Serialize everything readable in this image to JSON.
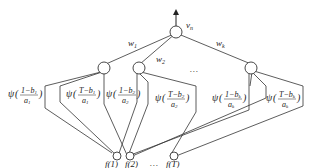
{
  "diagram": {
    "type": "neural-network",
    "output_node": {
      "label": "v",
      "subscript": "n"
    },
    "weights": [
      {
        "label": "w",
        "subscript": "1"
      },
      {
        "label": "w",
        "subscript": "2"
      },
      {
        "label": "w",
        "subscript": "k"
      }
    ],
    "hidden_ellipsis": "…",
    "activations": [
      {
        "psi": "ψ",
        "num": "1−b",
        "num_sub": "1",
        "den": "a",
        "den_sub": "1"
      },
      {
        "psi": "ψ",
        "num": "T−b",
        "num_sub": "1",
        "den": "a",
        "den_sub": "1"
      },
      {
        "psi": "ψ",
        "num": "1−b",
        "num_sub": "2",
        "den": "a",
        "den_sub": "2"
      },
      {
        "psi": "ψ",
        "num": "T−b",
        "num_sub": "2",
        "den": "a",
        "den_sub": "2"
      },
      {
        "psi": "ψ",
        "num": "1−b",
        "num_sub": "k",
        "den": "a",
        "den_sub": "k"
      },
      {
        "psi": "ψ",
        "num": "T−b",
        "num_sub": "k",
        "den": "a",
        "den_sub": "k"
      }
    ],
    "input_nodes": [
      {
        "label": "f(1)"
      },
      {
        "label": "f(2)"
      },
      {
        "label": "f(T)"
      }
    ],
    "input_ellipsis": "…"
  }
}
